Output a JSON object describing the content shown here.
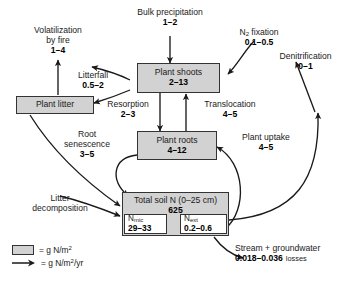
{
  "diagram": {
    "boxes": [
      {
        "id": "plant_shoots",
        "name": "Plant shoots",
        "value": "2–13"
      },
      {
        "id": "plant_litter",
        "name": "Plant litter",
        "value": ""
      },
      {
        "id": "plant_roots",
        "name": "Plant roots",
        "value": "4–12"
      },
      {
        "id": "total_soil_n",
        "name": "Total soil N (0–25 cm)",
        "value": "625"
      }
    ],
    "subboxes": [
      {
        "id": "n_mic",
        "name_prefix": "N",
        "name_sub": "mic",
        "value": "29–33"
      },
      {
        "id": "n_ext",
        "name_prefix": "N",
        "name_sub": "ext",
        "value": "0.2–0.6"
      }
    ],
    "flux_labels": [
      {
        "id": "bulk_precipitation",
        "label": "Bulk precipitation",
        "value": "1–2"
      },
      {
        "id": "volatilization_by_fire",
        "label_line1": "Volatilization",
        "label_line2": "by fire",
        "value": "1–4"
      },
      {
        "id": "n2_fixation",
        "label_prefix": "N",
        "label_sub": "2",
        "label_suffix": " fixation",
        "value": "0.1–0.5"
      },
      {
        "id": "denitrification",
        "label": "Denitrification",
        "value": "0–1"
      },
      {
        "id": "litterfall",
        "label": "Litterfall",
        "value": "0.5–2"
      },
      {
        "id": "resorption",
        "label": "Resorption",
        "value": "2–3"
      },
      {
        "id": "translocation",
        "label": "Translocation",
        "value": "4–5"
      },
      {
        "id": "plant_uptake",
        "label": "Plant uptake",
        "value": "4–5"
      },
      {
        "id": "root_senescence",
        "label_line1": "Root",
        "label_line2": "senescence",
        "value": "3–5"
      },
      {
        "id": "litter_decomposition",
        "label_line1": "Litter",
        "label_line2": "decomposition",
        "value": ""
      },
      {
        "id": "stream_groundwater_losses",
        "label_line1": "Stream + groundwater",
        "value": "0.018–0.036",
        "label_suffix": "losses"
      }
    ],
    "legend": [
      {
        "id": "pool-units",
        "symbol": "box-swatch",
        "text_prefix": "= g N/m",
        "text_sup": "2",
        "text_suffix": ""
      },
      {
        "id": "flux-units",
        "symbol": "arrow-glyph",
        "text_prefix": "= g N/m",
        "text_sup": "2",
        "text_suffix": "/yr"
      }
    ],
    "colors": {
      "pool_fill": "#d2d2d2",
      "subpool_fill": "#ffffff",
      "stroke": "#333333",
      "text": "#1a1a1a",
      "background": "#ffffff"
    }
  }
}
